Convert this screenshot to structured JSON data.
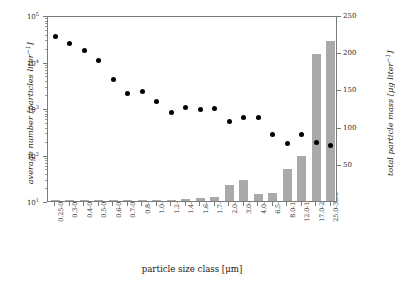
{
  "chart_data": {
    "type": "bar",
    "title": "",
    "xlabel": "particle size class [μm]",
    "ylabel": "average number [particles liter−1]",
    "ylabel_right": "total particle mass [μg liter−1]",
    "categories": [
      "0.25-0.28",
      "0.3-0.35",
      "0.4-0.45",
      "0.5-0.55",
      "0.6-0.65",
      "0.7-0.75",
      "0.8-0.9",
      "1.0-1.1",
      "1.2-1.3",
      "1.4-1.5",
      "1.6-1.7",
      "1.7-1.8",
      "2.0-2.5",
      "3.0-3.5",
      "4.0-5.0",
      "6.5-7.0",
      "8.0-10.0",
      "12.0-15.0",
      "17.0-20.0",
      "25.0-30.0"
    ],
    "series": [
      {
        "name": "average number [particles liter−1]",
        "axis": "left",
        "scale": "log",
        "marker": "circle",
        "color": "#000000",
        "values": [
          38000,
          27000,
          19000,
          11500,
          4600,
          2300,
          2450,
          1500,
          880,
          1150,
          1020,
          1070,
          560,
          700,
          690,
          300,
          195,
          300,
          205,
          175
        ]
      },
      {
        "name": "total particle mass [μg liter−1]",
        "axis": "right",
        "scale": "linear",
        "marker": "bar",
        "color": "#a9a9a9",
        "values": [
          0.4,
          0.5,
          0.6,
          0.7,
          0.8,
          1.0,
          1.2,
          1.5,
          2.0,
          3.0,
          4.0,
          5.0,
          22,
          28,
          10,
          11,
          43,
          60,
          197,
          215
        ]
      }
    ],
    "ylim": [
      10,
      100000
    ],
    "ylim_right": [
      0,
      250
    ],
    "yticks": [
      "10^1",
      "10^2",
      "10^3",
      "10^4",
      "10^5"
    ],
    "ytick_values": [
      10,
      100,
      1000,
      10000,
      100000
    ],
    "yticks_right": [
      0,
      50,
      100,
      150,
      200,
      250
    ],
    "grid": false,
    "legend": "none"
  },
  "axes": {
    "left_title": "average number [particles liter",
    "left_title_sup": "−1",
    "left_title_tail": "]",
    "right_title": "total particle mass [μg liter",
    "right_title_sup": "−1",
    "right_title_tail": "]",
    "x_title": "particle size class [μm]"
  },
  "colors": {
    "bar": "#a9a9a9",
    "dot": "#000000",
    "frame": "#7a7a7a",
    "background": "#ffffff",
    "text": "#1a1a1a"
  }
}
